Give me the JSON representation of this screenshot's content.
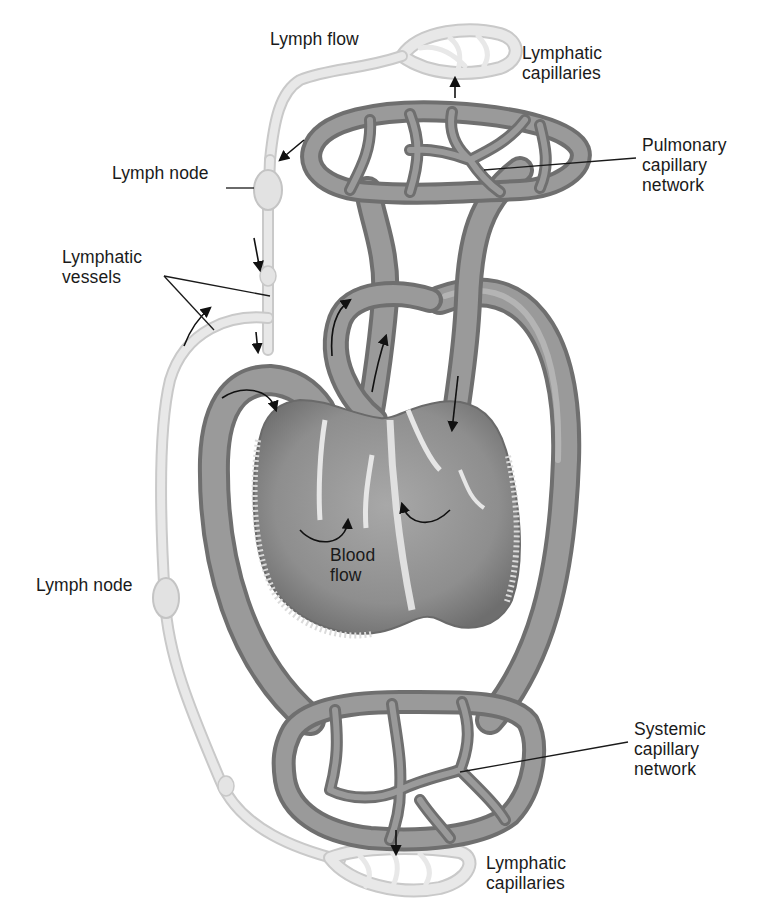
{
  "figure": {
    "colors": {
      "background": "#ffffff",
      "blood_vessel": "#8a8a8a",
      "blood_vessel_dark": "#6f6f6f",
      "lymph_vessel": "#e3e3e3",
      "lymph_vessel_edge": "#c9c9c9",
      "label_text": "#1a1a1a"
    }
  },
  "labels": [
    {
      "id": "lymph-flow",
      "text": "Lymph flow",
      "x": 270,
      "y": 44
    },
    {
      "id": "lymphatic-capillaries-top",
      "text": "Lymphatic\ncapillaries",
      "x": 522,
      "y": 58
    },
    {
      "id": "pulmonary-capillary-network",
      "text": "Pulmonary\ncapillary\nnetwork",
      "x": 642,
      "y": 150
    },
    {
      "id": "lymph-node-top",
      "text": "Lymph node",
      "x": 112,
      "y": 178
    },
    {
      "id": "lymphatic-vessels",
      "text": "Lymphatic\nvessels",
      "x": 62,
      "y": 262
    },
    {
      "id": "blood-flow",
      "text": "Blood\nflow",
      "x": 330,
      "y": 560
    },
    {
      "id": "lymph-node-bottom",
      "text": "Lymph node",
      "x": 36,
      "y": 590
    },
    {
      "id": "systemic-capillary-network",
      "text": "Systemic\ncapillary\nnetwork",
      "x": 634,
      "y": 734
    },
    {
      "id": "lymphatic-capillaries-bottom",
      "text": "Lymphatic\ncapillaries",
      "x": 486,
      "y": 868
    }
  ],
  "structures": [
    "heart",
    "pulmonary capillary network",
    "systemic capillary network",
    "lymphatic capillaries (top)",
    "lymphatic capillaries (bottom)",
    "lymphatic vessels",
    "lymph nodes",
    "aorta / systemic arch",
    "pulmonary trunk",
    "vena cava"
  ]
}
